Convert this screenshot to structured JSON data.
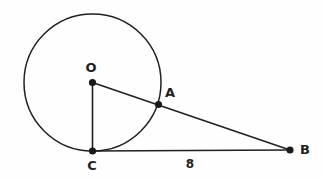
{
  "figure": {
    "width": 323,
    "height": 179,
    "background_color": "#fefefe",
    "stroke_color": "#231f20",
    "vertex_color": "#1a1a1a"
  },
  "circle": {
    "name": "circle-O",
    "center_x": 92.5,
    "center_y": 82.5,
    "radius": 68.5
  },
  "points": [
    {
      "id": "O",
      "label": "O",
      "x": 92.5,
      "y": 82.5,
      "label_x": 91,
      "label_y": 68,
      "dot_radius": 3.6
    },
    {
      "id": "A",
      "label": "A",
      "x": 158.5,
      "y": 104.5,
      "label_x": 170,
      "label_y": 93,
      "dot_radius": 3.6
    },
    {
      "id": "C",
      "label": "C",
      "x": 92.5,
      "y": 151,
      "label_x": 92,
      "label_y": 166,
      "dot_radius": 3.6
    },
    {
      "id": "B",
      "label": "B",
      "x": 290,
      "y": 150,
      "label_x": 305,
      "label_y": 150,
      "dot_radius": 3.6
    }
  ],
  "segments": [
    {
      "id": "OB",
      "name": "segment-o-to-b",
      "x1": 92.5,
      "y1": 82.5,
      "x2": 290,
      "y2": 150
    },
    {
      "id": "OC",
      "name": "segment-o-to-c",
      "x1": 92.5,
      "y1": 82.5,
      "x2": 92.5,
      "y2": 151
    },
    {
      "id": "CB",
      "name": "segment-c-to-b",
      "x1": 92.5,
      "y1": 151,
      "x2": 290,
      "y2": 150
    }
  ],
  "measurements": [
    {
      "id": "CB-length",
      "value": "8",
      "x": 190,
      "y": 164,
      "applies_to": "CB"
    }
  ]
}
